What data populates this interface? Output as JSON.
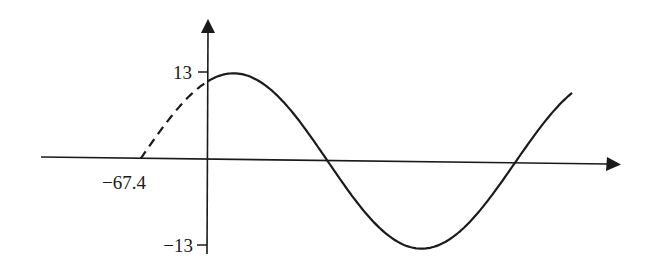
{
  "chart_data": {
    "type": "line",
    "title": "",
    "xlabel": "",
    "ylabel": "",
    "function_description": "Sinusoid with amplitude 13; dashed portion from x = -67.4 to x = 0, solid portion for x >= 0",
    "amplitude": 13,
    "phase_zero_crossing": -67.4,
    "period_estimate": 374,
    "y_ticks": [
      {
        "value": 13,
        "label": "13"
      },
      {
        "value": -13,
        "label": "-13"
      }
    ],
    "x_ticks": [
      {
        "value": -67.4,
        "label": "−67.4"
      }
    ],
    "ylim": [
      -13,
      13
    ],
    "xlim": [
      -67.4,
      365
    ],
    "grid": false,
    "legend": null,
    "series": [
      {
        "name": "dashed-segment",
        "style": "dashed",
        "x": [
          -67.4,
          -50,
          -30,
          -10,
          0
        ],
        "y": [
          0,
          3.7,
          7.7,
          10.8,
          11.9
        ]
      },
      {
        "name": "solid-segment",
        "style": "solid",
        "x": [
          0,
          26,
          120,
          213,
          307,
          365
        ],
        "y": [
          11.9,
          13,
          0,
          -13,
          0,
          8.0
        ]
      }
    ]
  },
  "labels": {
    "y_top": "13",
    "y_bottom": "−13",
    "x_intercept": "−67.4"
  }
}
